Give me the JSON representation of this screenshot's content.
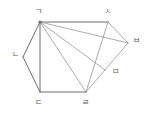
{
  "figure": {
    "type": "geometry-diagram",
    "shape": "hexagon-with-diagonals",
    "stroke_color": "#8a8a8a",
    "stroke_color_dark": "#6e6e6e",
    "label_color": "#5a5a5a",
    "background": "#ffffff",
    "viewbox": {
      "width": 147,
      "height": 122
    },
    "vertices": [
      {
        "id": "g",
        "label": "ㄱ",
        "x": 40,
        "y": 22,
        "label_x": 35,
        "label_y": 8,
        "dot": true
      },
      {
        "id": "n",
        "label": "ㄴ",
        "x": 23,
        "y": 57,
        "label_x": 12,
        "label_y": 51,
        "dot": false
      },
      {
        "id": "d",
        "label": "ㄷ",
        "x": 40,
        "y": 92,
        "label_x": 35,
        "label_y": 99,
        "dot": false
      },
      {
        "id": "r",
        "label": "ㄹ",
        "x": 86,
        "y": 92,
        "label_x": 82,
        "label_y": 99,
        "dot": false
      },
      {
        "id": "m",
        "label": "ㅁ",
        "x": 105,
        "y": 70,
        "label_x": 112,
        "label_y": 68,
        "dot": false
      },
      {
        "id": "b",
        "label": "ㅂ",
        "x": 128,
        "y": 43,
        "label_x": 133,
        "label_y": 37,
        "dot": false
      },
      {
        "id": "s",
        "label": "ㅅ",
        "x": 108,
        "y": 22,
        "label_x": 104,
        "label_y": 8,
        "dot": false
      }
    ],
    "edges": [
      {
        "name": "edge-g-s",
        "from": "g",
        "to": "s",
        "weight": "heavy"
      },
      {
        "name": "edge-s-b",
        "from": "s",
        "to": "b",
        "weight": "light"
      },
      {
        "name": "edge-b-m",
        "from": "b",
        "to": "m",
        "weight": "light"
      },
      {
        "name": "edge-m-r",
        "from": "m",
        "to": "r",
        "weight": "light"
      },
      {
        "name": "edge-r-d",
        "from": "r",
        "to": "d",
        "weight": "heavy"
      },
      {
        "name": "edge-d-n",
        "from": "d",
        "to": "n",
        "weight": "heavy"
      },
      {
        "name": "edge-n-g",
        "from": "n",
        "to": "g",
        "weight": "heavy"
      }
    ],
    "diagonals": [
      {
        "name": "diagonal-g-d",
        "from": "g",
        "to": "d",
        "weight": "heavy"
      },
      {
        "name": "diagonal-g-r",
        "from": "g",
        "to": "r",
        "weight": "light"
      },
      {
        "name": "diagonal-g-m",
        "from": "g",
        "to": "m",
        "weight": "light"
      },
      {
        "name": "diagonal-g-b",
        "from": "g",
        "to": "b",
        "weight": "light"
      },
      {
        "name": "diagonal-s-r",
        "from": "s",
        "to": "r",
        "weight": "light"
      }
    ]
  }
}
